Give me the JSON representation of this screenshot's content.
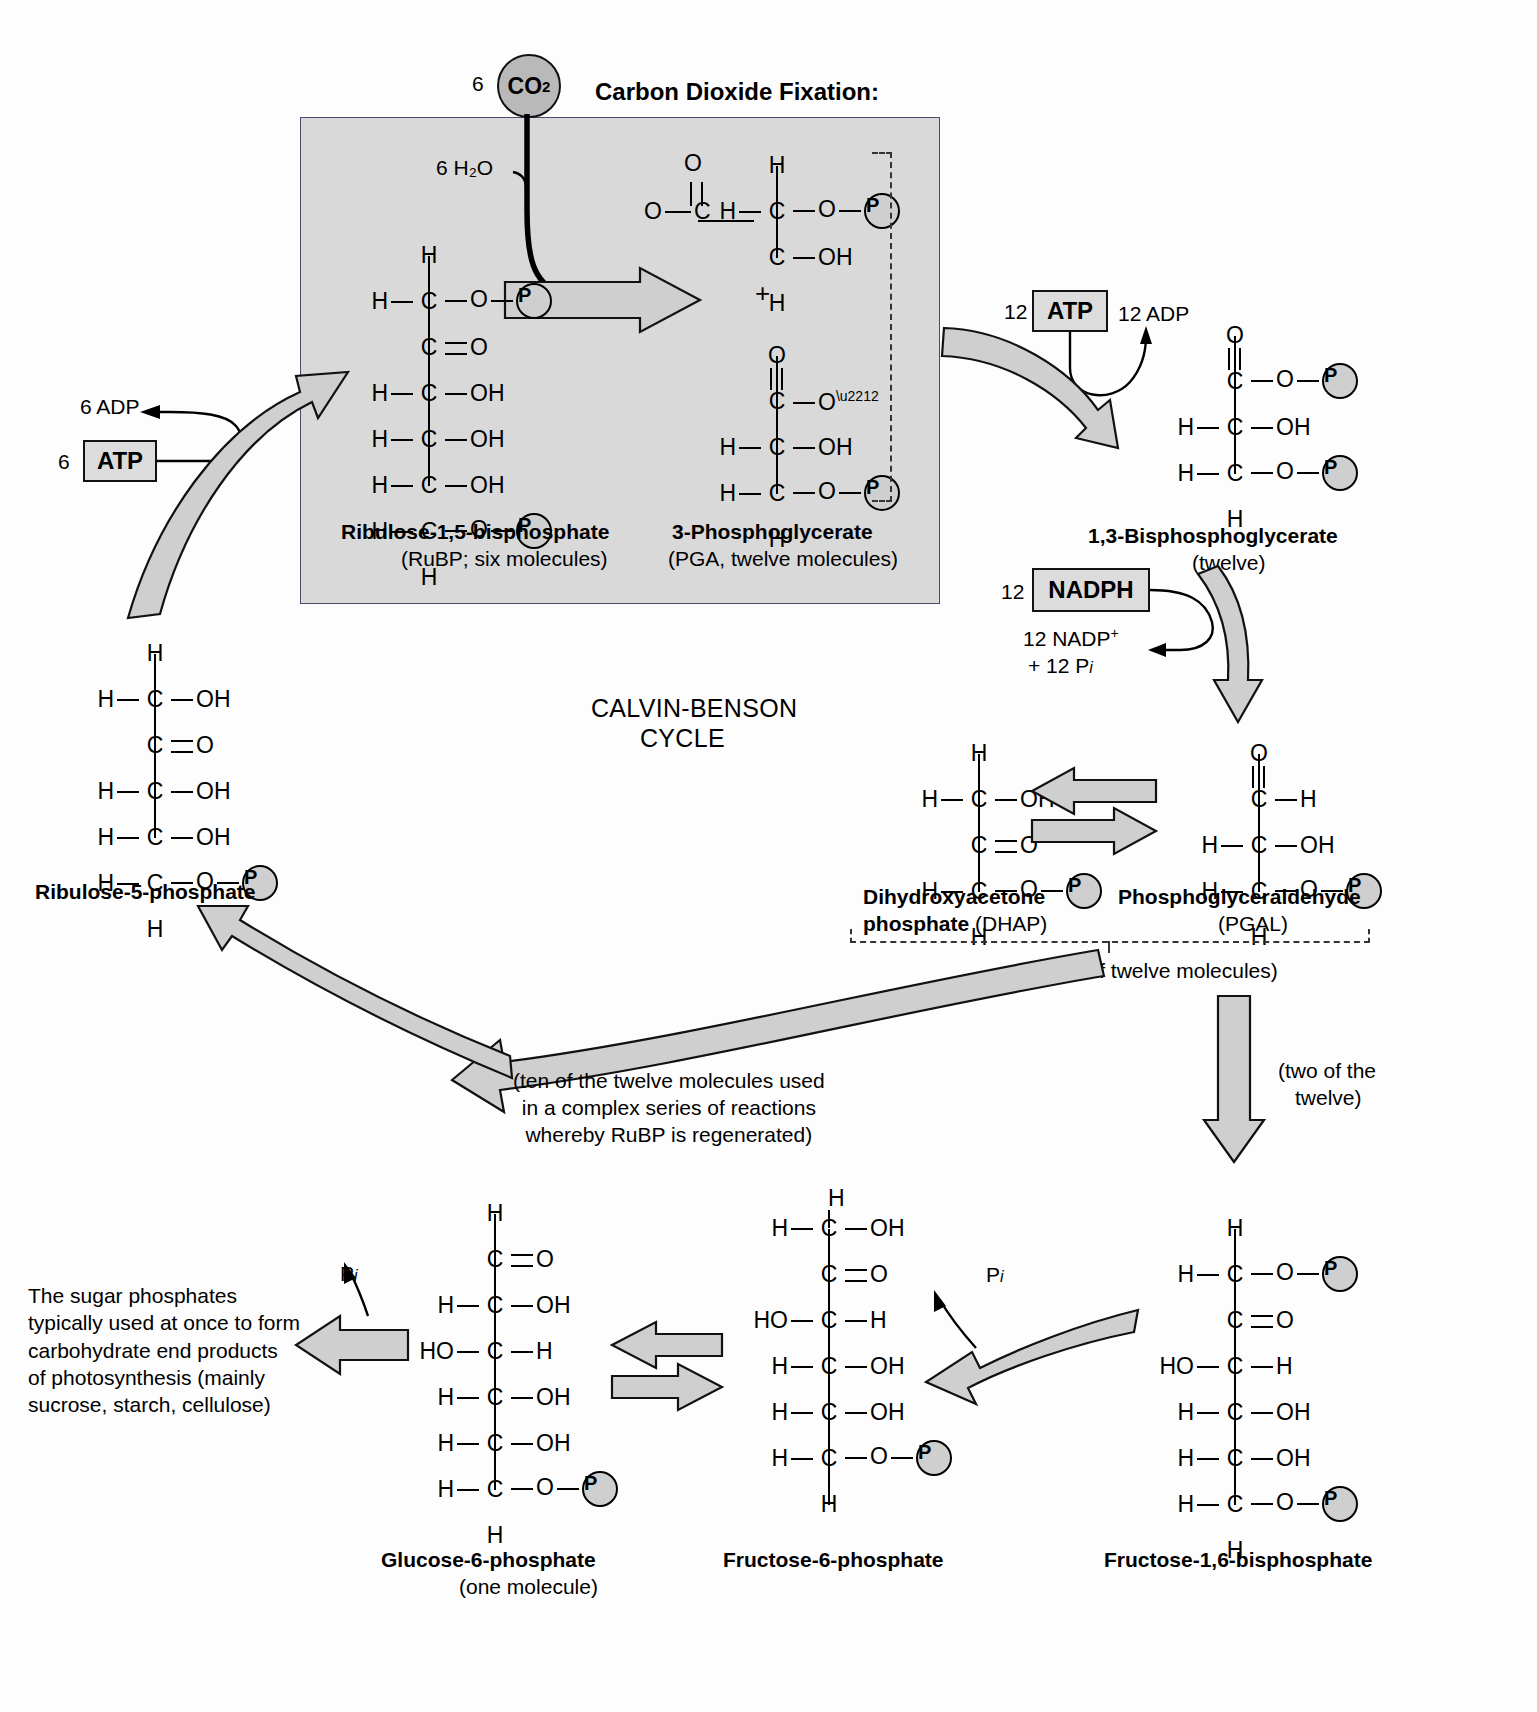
{
  "figure": {
    "center_title_line1": "CALVIN-BENSON",
    "center_title_line2": "CYCLE",
    "section_header": "Carbon Dioxide Fixation:"
  },
  "inputs": {
    "co2_count": "6",
    "co2_label": "CO",
    "co2_sub": "2",
    "water_label": "6 H₂O"
  },
  "cofactors": {
    "atp_left_count": "6",
    "atp_left_label": "ATP",
    "adp_left_label": "6 ADP",
    "atp_right_count": "12",
    "atp_right_label": "ATP",
    "adp_right_label": "12 ADP",
    "nadph_count": "12",
    "nadph_label": "NADPH",
    "nadp_line1": "12 NADP",
    "nadp_sup": "+",
    "nadp_line2_pre": "+ 12 P",
    "nadp_line2_sub": "i"
  },
  "molecules": {
    "rubp": {
      "name": "Ribulose-1,5-bisphosphate",
      "sub": "(RuBP; six molecules)",
      "rows": [
        {
          "left": "",
          "center": "H",
          "right": "",
          "type": "cap"
        },
        {
          "left": "H",
          "center": "C",
          "right": "O — P",
          "type": "phos"
        },
        {
          "left": "",
          "center": "C",
          "right": "O",
          "type": "dbl"
        },
        {
          "left": "H",
          "center": "C",
          "right": "OH",
          "type": "oh"
        },
        {
          "left": "H",
          "center": "C",
          "right": "OH",
          "type": "oh"
        },
        {
          "left": "H",
          "center": "C",
          "right": "OH",
          "type": "oh"
        },
        {
          "left": "H",
          "center": "C",
          "right": "O — P",
          "type": "phos"
        },
        {
          "left": "",
          "center": "H",
          "right": "",
          "type": "cap"
        }
      ]
    },
    "pga": {
      "name": "3-Phosphoglycerate",
      "sub": "(PGA, twelve molecules)",
      "plus": "+",
      "top_rows": [
        {
          "left": "",
          "center": "H",
          "right": ""
        },
        {
          "left": "H",
          "center": "C",
          "right": "O — P"
        },
        {
          "left": "O⁻ — C(=O) —",
          "center": "C",
          "right": "OH"
        },
        {
          "left": "",
          "center": "H",
          "right": ""
        }
      ],
      "bottom_rows": [
        {
          "left": "",
          "center": "O",
          "right": ""
        },
        {
          "left": "",
          "center": "C",
          "right": "O⁻"
        },
        {
          "left": "H",
          "center": "C",
          "right": "OH"
        },
        {
          "left": "H",
          "center": "C",
          "right": "O — P"
        },
        {
          "left": "",
          "center": "H",
          "right": ""
        }
      ]
    },
    "bpg": {
      "name": "1,3-Bisphosphoglycerate",
      "sub": "(twelve)"
    },
    "pgal": {
      "name": "Phosphoglyceraldehyde",
      "sub": "(PGAL)"
    },
    "dhap": {
      "name_bold": "Dihydroxyacetone",
      "name_bold2": "phosphate",
      "name_plain": "(DHAP)"
    },
    "ru5p": {
      "name": "Ribulose-5-phosphate"
    },
    "g6p": {
      "name": "Glucose-6-phosphate",
      "sub": "(one molecule)"
    },
    "f6p": {
      "name": "Fructose-6-phosphate"
    },
    "fbp": {
      "name": "Fructose-1,6-bisphosphate"
    }
  },
  "annotations": {
    "total_twelve": "(total of twelve molecules)",
    "two_of_twelve_line1": "(two of the",
    "two_of_twelve_line2": "twelve)",
    "ten_of_twelve": "(ten of the twelve molecules used\nin a complex series of reactions\nwhereby RuBP is regenerated)",
    "sugar_note": "The sugar phosphates\ntypically used at once to form\ncarbohydrate end products\nof photosynthesis (mainly\nsucrose, starch, cellulose)",
    "pi_label_pre": "P",
    "pi_label_sub": "i"
  },
  "colors": {
    "box_fill": "#d9d9d9",
    "arrow_fill": "#cfcfcf",
    "stroke": "#111111",
    "page_bg": "#fdfdfd"
  }
}
